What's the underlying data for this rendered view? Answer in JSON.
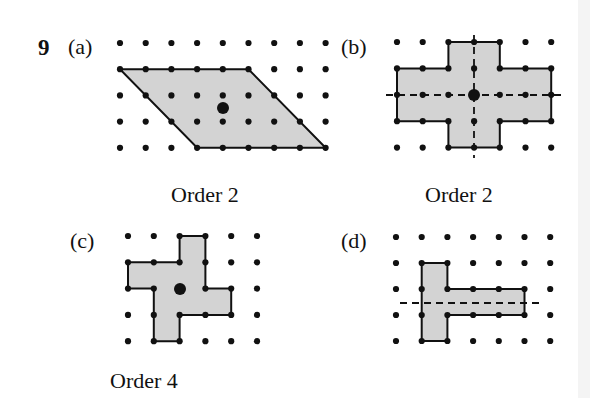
{
  "question": {
    "number": "9",
    "parts": [
      {
        "id": "a",
        "label": "(a)",
        "caption": "Order 2",
        "grid": {
          "x0": 120,
          "y0": 43,
          "dx": 25.7,
          "dy": 26.2,
          "cols": 9,
          "rows": 5
        },
        "shape": [
          [
            0,
            1
          ],
          [
            5,
            1
          ],
          [
            8,
            4
          ],
          [
            3,
            4
          ]
        ],
        "center": [
          223,
          108
        ],
        "mirror_lines": []
      },
      {
        "id": "b",
        "label": "(b)",
        "caption": "Order 2",
        "grid": {
          "x0": 397,
          "y0": 42,
          "dx": 25.7,
          "dy": 26.4,
          "cols": 7,
          "rows": 5
        },
        "shape": [
          [
            2,
            0
          ],
          [
            4,
            0
          ],
          [
            4,
            1
          ],
          [
            6,
            1
          ],
          [
            6,
            3
          ],
          [
            4,
            3
          ],
          [
            4,
            4
          ],
          [
            2,
            4
          ],
          [
            2,
            3
          ],
          [
            0,
            3
          ],
          [
            0,
            1
          ],
          [
            2,
            1
          ]
        ],
        "center": [
          474,
          95
        ],
        "mirror_lines": [
          {
            "x1": 386,
            "y1": 95,
            "x2": 562,
            "y2": 95
          },
          {
            "x1": 474,
            "y1": 35,
            "x2": 474,
            "y2": 158
          }
        ]
      },
      {
        "id": "c",
        "label": "(c)",
        "caption": "Order 4",
        "grid": {
          "x0": 128,
          "y0": 236,
          "dx": 25.8,
          "dy": 26.3,
          "cols": 6,
          "rows": 5
        },
        "shape": [
          [
            2,
            0
          ],
          [
            3,
            0
          ],
          [
            3,
            2
          ],
          [
            4,
            2
          ],
          [
            4,
            3
          ],
          [
            2,
            3
          ],
          [
            2,
            4
          ],
          [
            1,
            4
          ],
          [
            1,
            2
          ],
          [
            0,
            2
          ],
          [
            0,
            1
          ],
          [
            2,
            1
          ]
        ],
        "center": [
          180,
          289
        ],
        "mirror_lines": []
      },
      {
        "id": "d",
        "label": "(d)",
        "caption": "",
        "grid": {
          "x0": 396,
          "y0": 237,
          "dx": 25.7,
          "dy": 26.0,
          "cols": 7,
          "rows": 5
        },
        "shape": [
          [
            1,
            1
          ],
          [
            2,
            1
          ],
          [
            2,
            2
          ],
          [
            5,
            2
          ],
          [
            5,
            3
          ],
          [
            2,
            3
          ],
          [
            2,
            4
          ],
          [
            1,
            4
          ]
        ],
        "center": null,
        "mirror_lines": [
          {
            "x1": 400,
            "y1": 303,
            "x2": 540,
            "y2": 303
          }
        ]
      }
    ]
  },
  "colors": {
    "fill": "#d3d3d3",
    "stroke": "#111111",
    "dot": "#111111"
  }
}
